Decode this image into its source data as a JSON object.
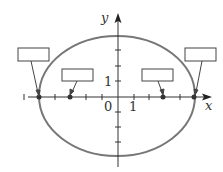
{
  "diagram": {
    "type": "ellipse-with-foci",
    "equation_implied": "x^2/25 + y^2/16 = 1",
    "axes": {
      "x_label": "x",
      "y_label": "y",
      "origin_label": "0",
      "x_unit_label": "1",
      "y_unit_label": "1",
      "x_ticks": [
        -6,
        -5,
        -4,
        -3,
        -2,
        -1,
        1,
        2,
        3,
        4,
        5
      ],
      "y_ticks": [
        -5,
        -4,
        -3,
        -2,
        -1,
        1,
        2,
        3,
        4
      ]
    },
    "ellipse": {
      "a": 5,
      "b": 4,
      "color": "#777777"
    },
    "points": [
      {
        "name": "left-vertex",
        "x": -5,
        "y": 0
      },
      {
        "name": "left-focus",
        "x": -3,
        "y": 0
      },
      {
        "name": "right-focus",
        "x": 3,
        "y": 0
      },
      {
        "name": "right-vertex",
        "x": 5,
        "y": 0
      }
    ],
    "label_boxes": [
      {
        "name": "left-vertex-label-box",
        "text": ""
      },
      {
        "name": "left-focus-label-box",
        "text": ""
      },
      {
        "name": "right-focus-label-box",
        "text": ""
      },
      {
        "name": "right-vertex-label-box",
        "text": ""
      }
    ]
  }
}
